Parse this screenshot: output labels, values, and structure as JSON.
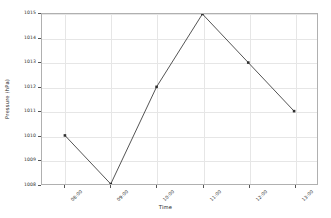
{
  "chart_data": {
    "type": "line",
    "title": "",
    "xlabel": "Time",
    "ylabel": "Pressure (hPa)",
    "categories": [
      "08:00",
      "09:00",
      "10:00",
      "11:00",
      "12:00",
      "13:00"
    ],
    "values": [
      1010,
      1008,
      1012,
      1015,
      1013,
      1011
    ],
    "series": [
      {
        "name": "Pressure",
        "values": [
          1010,
          1008,
          1012,
          1015,
          1013,
          1011
        ]
      }
    ],
    "ylim": [
      1008,
      1015
    ],
    "yticks": [
      1008,
      1009,
      1010,
      1011,
      1012,
      1013,
      1014,
      1015
    ],
    "ytick_labels": [
      "1008",
      "1009",
      "1010",
      "1011",
      "1012",
      "1013",
      "1014",
      "1015"
    ],
    "xtick_labels": [
      "08:00",
      "09:00",
      "10:00",
      "11:00",
      "12:00",
      "13:00"
    ],
    "grid": true,
    "legend": null,
    "marker": "square",
    "line_color": "#3f3f3f",
    "marker_color": "#2f2f2f",
    "grid_color": "#e6e6e6",
    "axes_color": "#b0b0b0",
    "background_color": "#ffffff"
  }
}
